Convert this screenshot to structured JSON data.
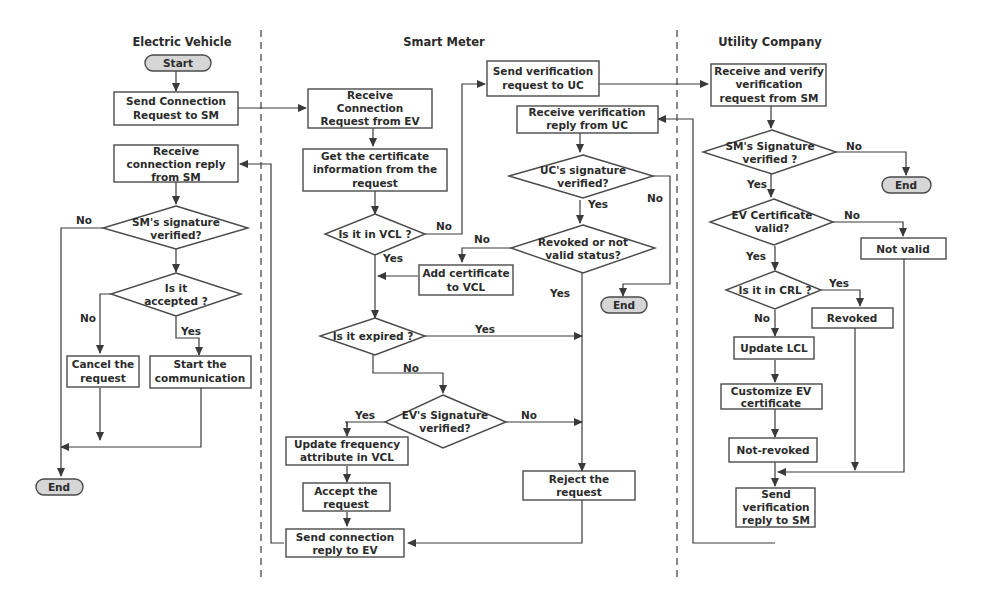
{
  "lanes": [
    {
      "id": "ev",
      "title": "Electric Vehicle"
    },
    {
      "id": "sm",
      "title": "Smart Meter"
    },
    {
      "id": "uc",
      "title": "Utility Company"
    }
  ],
  "nodes": {
    "ev_start": [
      "Start"
    ],
    "ev_send_req": [
      "Send Connection",
      "Request to SM"
    ],
    "ev_recv_reply": [
      "Receive",
      "connection reply",
      "from SM"
    ],
    "ev_sm_sig": [
      "SM's signature",
      "verified?"
    ],
    "ev_accepted": [
      "Is it",
      "accepted ?"
    ],
    "ev_cancel": [
      "Cancel the",
      "request"
    ],
    "ev_start_comm": [
      "Start the",
      "communication"
    ],
    "ev_end": [
      "End"
    ],
    "sm_recv_req": [
      "Receive",
      "Connection",
      "Request from EV"
    ],
    "sm_get_cert": [
      "Get the certificate",
      "information from the",
      "request"
    ],
    "sm_in_vcl": [
      "Is it in VCL ?"
    ],
    "sm_add_vcl": [
      "Add certificate",
      "to VCL"
    ],
    "sm_expired": [
      "Is it expired ?"
    ],
    "sm_ev_sig": [
      "EV's Signature",
      "verified?"
    ],
    "sm_update_freq": [
      "Update frequency",
      "attribute in VCL"
    ],
    "sm_accept": [
      "Accept the",
      "request"
    ],
    "sm_send_reply": [
      "Send connection",
      "reply to EV"
    ],
    "sm_send_verif": [
      "Send verification",
      "request to UC"
    ],
    "sm_recv_verif": [
      "Receive verification",
      "reply from UC"
    ],
    "sm_uc_sig": [
      "UC's signature",
      "verified?"
    ],
    "sm_revoked": [
      "Revoked or not",
      "valid status?"
    ],
    "sm_end": [
      "End"
    ],
    "sm_reject": [
      "Reject the",
      "request"
    ],
    "uc_recv": [
      "Receive and verify",
      "verification",
      "request from SM"
    ],
    "uc_sm_sig": [
      "SM's Signature",
      "verified ?"
    ],
    "uc_end": [
      "End"
    ],
    "uc_cert_valid": [
      "EV Certificate",
      "valid?"
    ],
    "uc_not_valid": [
      "Not valid"
    ],
    "uc_in_crl": [
      "Is it in CRL ?"
    ],
    "uc_revoked": [
      "Revoked"
    ],
    "uc_update_lcl": [
      "Update LCL"
    ],
    "uc_customize": [
      "Customize EV",
      "certificate"
    ],
    "uc_not_revoked": [
      "Not-revoked"
    ],
    "uc_send_reply": [
      "Send",
      "verification",
      "reply to SM"
    ]
  },
  "edge_labels": {
    "ev_sig_no": "No",
    "ev_acc_no": "No",
    "ev_acc_yes": "Yes",
    "vcl_no": "No",
    "vcl_yes": "Yes",
    "expired_yes": "Yes",
    "expired_no": "No",
    "evsig_yes": "Yes",
    "evsig_no": "No",
    "ucsig_yes": "Yes",
    "ucsig_no": "No",
    "revoked_no": "No",
    "revoked_yes": "Yes",
    "uc_smsig_no": "No",
    "uc_smsig_yes": "Yes",
    "cert_no": "No",
    "cert_yes": "Yes",
    "crl_yes": "Yes",
    "crl_no": "No"
  },
  "colors": {
    "terminal_fill": "#d6d6d6",
    "stroke": "#4a4a4a",
    "background": "#ffffff"
  }
}
